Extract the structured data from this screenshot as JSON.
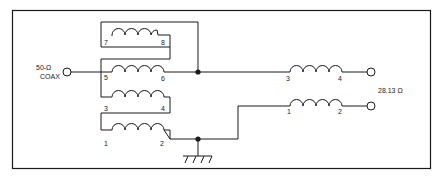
{
  "diagram": {
    "type": "transformer-schematic",
    "input": {
      "label_line1": "50-Ω",
      "label_line2": "COAX"
    },
    "output": {
      "impedance_label": "28.13 Ω"
    },
    "left_windings": [
      {
        "id": "w78",
        "start_pin": "7",
        "end_pin": "8"
      },
      {
        "id": "w56",
        "start_pin": "5",
        "end_pin": "6"
      },
      {
        "id": "w34",
        "start_pin": "3",
        "end_pin": "4"
      },
      {
        "id": "w12",
        "start_pin": "1",
        "end_pin": "2"
      }
    ],
    "right_windings": [
      {
        "id": "rw34",
        "start_pin": "3",
        "end_pin": "4"
      },
      {
        "id": "rw12",
        "start_pin": "1",
        "end_pin": "2"
      }
    ],
    "ground_symbol": "ground",
    "colors": {
      "line": "#1a1a1a",
      "background": "#ffffff"
    }
  }
}
